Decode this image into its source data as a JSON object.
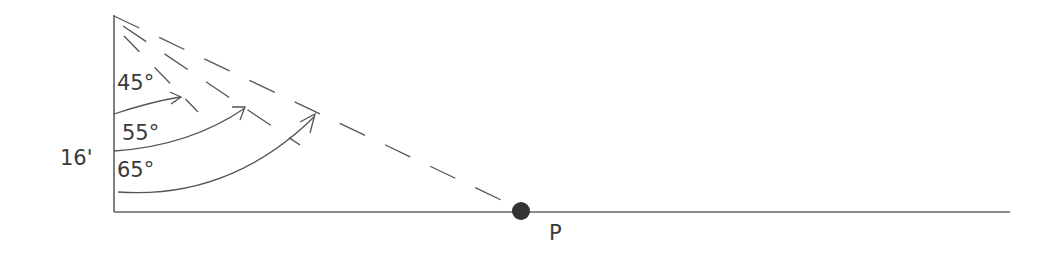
{
  "diagram": {
    "height_label": "16'",
    "point_label": "P",
    "angles": [
      {
        "label": "45°"
      },
      {
        "label": "55°"
      },
      {
        "label": "65°"
      }
    ],
    "colors": {
      "stroke": "#555555",
      "point": "#333333"
    }
  }
}
